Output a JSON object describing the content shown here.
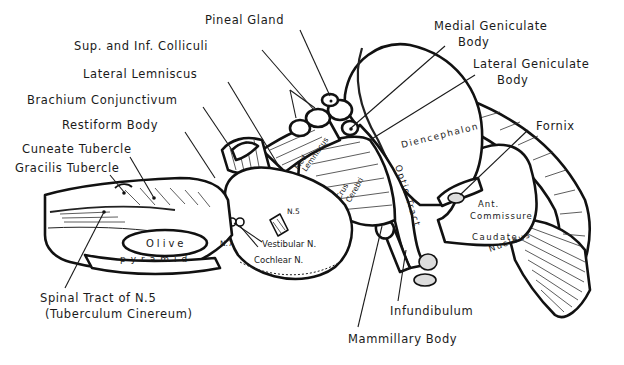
{
  "diagram": {
    "labels": {
      "pineal_gland": "Pineal Gland",
      "sup_inf_colliculi": "Sup. and Inf. Colliculi",
      "lateral_lemniscus": "Lateral Lemniscus",
      "brachium_conjunctivum": "Brachium Conjunctivum",
      "restiform_body": "Restiform Body",
      "cuneate_tubercle": "Cuneate Tubercle",
      "gracilis_tubercle": "Gracilis Tubercle",
      "medial_geniculate_line1": "Medial Geniculate",
      "medial_geniculate_line2": "Body",
      "lateral_geniculate_line1": "Lateral Geniculate",
      "lateral_geniculate_line2": "Body",
      "fornix": "Fornix",
      "spinal_tract_line1": "Spinal Tract of N.5",
      "spinal_tract_line2": "(Tuberculum Cinereum)",
      "infundibulum": "Infundibulum",
      "mammillary_body": "Mammillary Body"
    },
    "inner_labels": {
      "diencephalon": "Diencephalon",
      "optic_tract": "Optic Tract",
      "crus": "Crus",
      "cerebri": "Cerebri",
      "med": "Med.",
      "lemniscus": "Lemniscus",
      "olive": "Olive",
      "pyramid": "pyramid",
      "n5": "N.5",
      "n7": "N.7",
      "vestibular_n": "Vestibular N.",
      "cochlear_n": "Cochlear N.",
      "ant": "Ant.",
      "commissure": "Commissure",
      "caudate": "Caudate",
      "nucleus": "Nucleus"
    },
    "colors": {
      "line": "#111111",
      "background": "#ffffff"
    }
  }
}
